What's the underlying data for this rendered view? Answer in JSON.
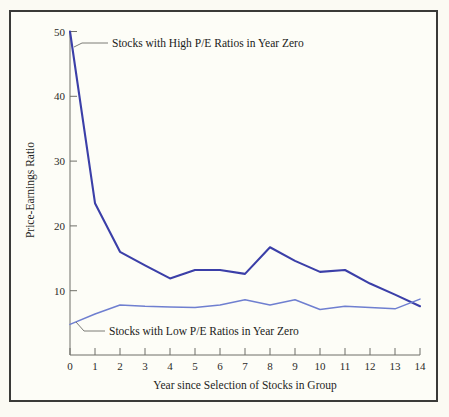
{
  "figure": {
    "background_color": "#fdfdf7",
    "frame_color": "#3a3a38"
  },
  "chart_data": {
    "type": "line",
    "title": "",
    "xlabel": "Year since Selection of Stocks in Group",
    "ylabel": "Price-Earnings Ratio",
    "x": [
      0,
      1,
      2,
      3,
      4,
      5,
      6,
      7,
      8,
      9,
      10,
      11,
      12,
      13,
      14
    ],
    "xlim": [
      0,
      14
    ],
    "ylim": [
      0,
      50
    ],
    "xticks": [
      "0",
      "1",
      "2",
      "3",
      "4",
      "5",
      "6",
      "7",
      "8",
      "9",
      "10",
      "11",
      "12",
      "13",
      "14"
    ],
    "yticks": [
      "10",
      "20",
      "30",
      "40",
      "50"
    ],
    "ytick_values": [
      10,
      20,
      30,
      40,
      50
    ],
    "grid": false,
    "legend_position": "inline-annotations",
    "series": [
      {
        "name": "Stocks with High P/E Ratios in Year Zero",
        "color": "#3b3fa8",
        "values": [
          50.0,
          23.5,
          16.0,
          13.9,
          11.9,
          13.2,
          13.2,
          12.6,
          16.7,
          14.6,
          12.9,
          13.2,
          11.1,
          9.4,
          7.6
        ]
      },
      {
        "name": "Stocks with Low P/E Ratios in Year Zero",
        "color": "#6f7fd0",
        "values": [
          4.8,
          6.4,
          7.8,
          7.6,
          7.5,
          7.4,
          7.8,
          8.6,
          7.8,
          8.6,
          7.1,
          7.6,
          7.4,
          7.2,
          8.7
        ]
      }
    ],
    "annotations": [
      {
        "text": "Stocks with High P/E Ratios in Year Zero",
        "target_series": "Stocks with High P/E Ratios in Year Zero"
      },
      {
        "text": "Stocks with Low P/E Ratios in Year Zero",
        "target_series": "Stocks with Low P/E Ratios in Year Zero"
      }
    ]
  }
}
